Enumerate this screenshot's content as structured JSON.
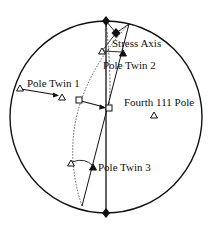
{
  "diagram": {
    "type": "stereographic-projection",
    "labels": {
      "stress_axis": "Stress Axis",
      "pole_twin_1": "Pole Twin 1",
      "pole_twin_2": "Pole Twin 2",
      "pole_twin_3": "Pole Twin 3",
      "fourth_pole": "Fourth 111 Pole"
    },
    "colors": {
      "stroke": "#111111",
      "background": "#ffffff"
    }
  }
}
